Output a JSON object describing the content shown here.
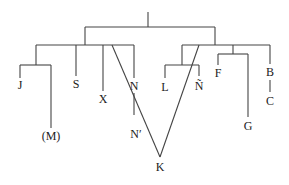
{
  "diagram": {
    "type": "tree",
    "colors": {
      "line": "#444444",
      "text": "#222222",
      "background": "#ffffff"
    },
    "nodes": {
      "J": "J",
      "M": "(M)",
      "S": "S",
      "X": "X",
      "N": "N",
      "N_prime": "N′",
      "K": "K",
      "L": "L",
      "N_tilde": "Ñ",
      "F": "F",
      "G": "G",
      "B": "B",
      "C": "C"
    },
    "edges": [
      [
        "root",
        "left-group"
      ],
      [
        "root",
        "right-group"
      ],
      [
        "left-group",
        "J-group"
      ],
      [
        "left-group",
        "S"
      ],
      [
        "left-group",
        "X"
      ],
      [
        "left-group",
        "N"
      ],
      [
        "J-group",
        "J"
      ],
      [
        "J-group",
        "M"
      ],
      [
        "N",
        "N_prime"
      ],
      [
        "left-group",
        "K"
      ],
      [
        "right-group",
        "L-group"
      ],
      [
        "right-group",
        "F-group"
      ],
      [
        "right-group",
        "B"
      ],
      [
        "L-group",
        "L"
      ],
      [
        "L-group",
        "N_tilde"
      ],
      [
        "N_tilde",
        "K"
      ],
      [
        "F-group",
        "F"
      ],
      [
        "F-group",
        "G"
      ],
      [
        "B",
        "C"
      ]
    ]
  }
}
